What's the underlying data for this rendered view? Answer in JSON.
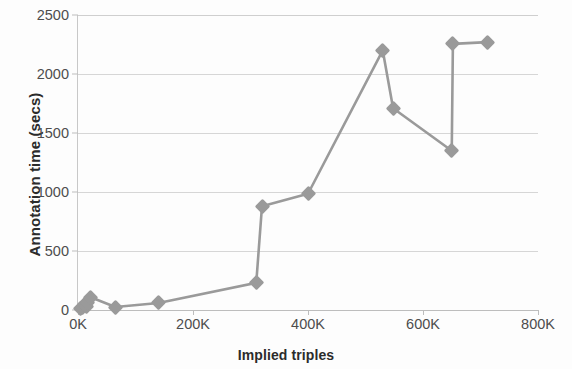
{
  "chart_data": {
    "type": "line",
    "title": "",
    "xlabel": "Implied triples",
    "ylabel": "Annotation time (secs)",
    "xlim": [
      0,
      800000
    ],
    "ylim": [
      0,
      2500
    ],
    "xtick_labels": [
      "0K",
      "200K",
      "400K",
      "600K",
      "800K"
    ],
    "xtick_values": [
      0,
      200000,
      400000,
      600000,
      800000
    ],
    "ytick_labels": [
      "0",
      "500",
      "1000",
      "1500",
      "2000",
      "2500"
    ],
    "ytick_values": [
      0,
      500,
      1000,
      1500,
      2000,
      2500
    ],
    "grid": "horizontal",
    "legend": "none",
    "marker": "diamond",
    "series_color": "#9a9a9a",
    "grid_color": "#d6d6d6",
    "series": [
      {
        "name": "Annotation time",
        "points": [
          [
            4000,
            10
          ],
          [
            8000,
            25
          ],
          [
            11000,
            45
          ],
          [
            14000,
            30
          ],
          [
            17000,
            60
          ],
          [
            21000,
            110
          ],
          [
            65000,
            25
          ],
          [
            140000,
            60
          ],
          [
            310000,
            230
          ],
          [
            320000,
            880
          ],
          [
            400000,
            985
          ],
          [
            530000,
            2200
          ],
          [
            548000,
            1710
          ],
          [
            650000,
            1350
          ],
          [
            652000,
            2255
          ],
          [
            712000,
            2270
          ]
        ]
      }
    ]
  }
}
